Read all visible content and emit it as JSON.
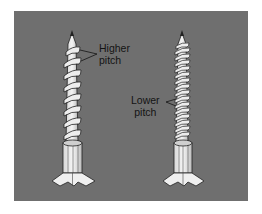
{
  "figure": {
    "background_color": "#6f6f6f",
    "screws": [
      {
        "name": "coarse-thread-screw",
        "label_line1": "Higher",
        "label_line2": "pitch",
        "thread_turns": 9
      },
      {
        "name": "fine-thread-screw",
        "label_line1": "Lower",
        "label_line2": "pitch",
        "thread_turns": 18
      }
    ]
  }
}
